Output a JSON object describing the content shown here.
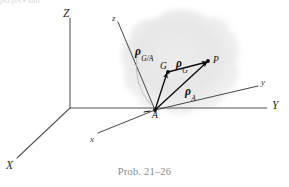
{
  "figure": {
    "caption": "Prob. 21–26",
    "top_bleed_text": "ρG  ρA   ▪ ωm",
    "background_color": "#ffffff",
    "ink_color": "#1a1a1a",
    "blob_color": "#e2e2e2",
    "caption_color": "#8a8a8a",
    "axes": {
      "fixed": [
        {
          "name": "axis-label-Z",
          "label": "Z",
          "x": 63,
          "y": 8
        },
        {
          "name": "axis-label-Y",
          "label": "Y",
          "x": 272,
          "y": 105
        },
        {
          "name": "axis-label-X",
          "label": "X",
          "x": 6,
          "y": 163
        }
      ],
      "body": [
        {
          "name": "axis-label-z-lower",
          "label": "z",
          "x": 112,
          "y": 15
        },
        {
          "name": "axis-label-y-lower",
          "label": "y",
          "x": 262,
          "y": 82
        },
        {
          "name": "axis-label-x-lower",
          "label": "x",
          "x": 91,
          "y": 138
        }
      ]
    },
    "points": [
      {
        "name": "point-A",
        "label": "A",
        "x": 155,
        "y": 110
      },
      {
        "name": "point-G",
        "label": "G",
        "x": 163,
        "y": 62
      },
      {
        "name": "point-P",
        "label": "P",
        "x": 212,
        "y": 57
      }
    ],
    "vectors": [
      {
        "name": "vector-rho-G-over-A",
        "symbol": "ρ",
        "subscript": "G/A",
        "x": 137,
        "y": 44
      },
      {
        "name": "vector-rho-G",
        "symbol": "ρ",
        "subscript": "G",
        "x": 177,
        "y": 57
      },
      {
        "name": "vector-rho-A",
        "symbol": "ρ",
        "subscript": "A",
        "x": 186,
        "y": 84
      }
    ]
  }
}
